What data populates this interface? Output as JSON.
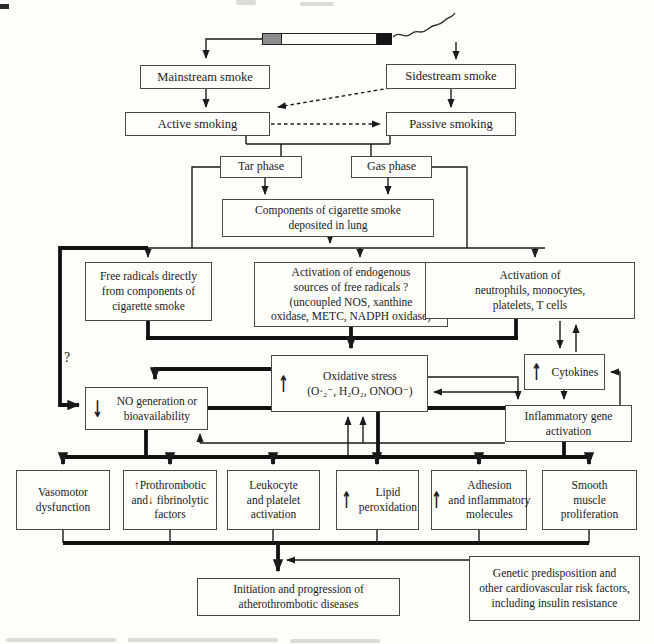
{
  "figure_type": "flowchart",
  "colors": {
    "paper": "#fdfdfa",
    "line": "#1a1a1a",
    "box_border": "#4a4a4a",
    "cigarette_filter": "#8d8d8d",
    "cigarette_tip": "#151515"
  },
  "glyphs": {
    "up_arrow": "↑",
    "down_arrow": "↓",
    "question_mark": "?"
  },
  "nodes": {
    "mainstream": {
      "lines": [
        "Mainstream smoke"
      ]
    },
    "sidestream": {
      "lines": [
        "Sidestream smoke"
      ]
    },
    "active": {
      "lines": [
        "Active smoking"
      ]
    },
    "passive": {
      "lines": [
        "Passive smoking"
      ]
    },
    "tar": {
      "lines": [
        "Tar phase"
      ]
    },
    "gas": {
      "lines": [
        "Gas phase"
      ]
    },
    "components": {
      "lines": [
        "Components of cigarette smoke",
        "deposited in lung"
      ]
    },
    "freerad": {
      "lines": [
        "Free radicals directly",
        "from components of",
        "cigarette smoke"
      ]
    },
    "endogenous": {
      "lines": [
        "Activation of endogenous",
        "sources of free radicals ?",
        "(uncoupled NOS, xanthine",
        "oxidase, METC, NADPH oxidase)"
      ]
    },
    "neutrophils": {
      "lines": [
        "Activation of",
        "neutrophils, monocytes,",
        "platelets, T cells"
      ]
    },
    "oxidative": {
      "arrow": "↑",
      "lines": [
        "Oxidative stress",
        "(O·₂⁻, H₂O₂, ONOO⁻)"
      ]
    },
    "cytokines": {
      "arrow": "↑",
      "lines": [
        "Cytokines"
      ]
    },
    "nogen": {
      "arrow": "↓",
      "lines": [
        "NO generation or",
        "bioavailability"
      ]
    },
    "inflammatory": {
      "lines": [
        "Inflammatory gene",
        "activation"
      ]
    },
    "vasomotor": {
      "lines": [
        "Vasomotor",
        "dysfunction"
      ]
    },
    "prothrombotic": {
      "lines": [
        "↑Prothrombotic",
        "and↓ fibrinolytic",
        "factors"
      ]
    },
    "leukocyte": {
      "lines": [
        "Leukocyte",
        "and platelet",
        "activation"
      ]
    },
    "lipid": {
      "arrow": "↑",
      "lines": [
        "Lipid",
        "peroxidation"
      ]
    },
    "adhesion": {
      "arrow": "↑",
      "lines": [
        "Adhesion",
        "and inflammatory",
        "molecules"
      ]
    },
    "smooth": {
      "lines": [
        "Smooth",
        "muscle",
        "proliferation"
      ]
    },
    "genetic": {
      "lines": [
        "Genetic predisposition and",
        "other cardiovascular risk factors,",
        "including insulin resistance"
      ]
    },
    "initiation": {
      "lines": [
        "Initiation and progression of",
        "atherothrombotic diseases"
      ]
    }
  }
}
